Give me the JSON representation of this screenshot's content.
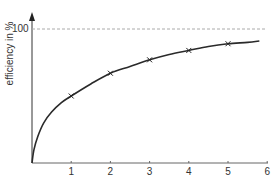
{
  "chart_data": {
    "type": "line",
    "title": "",
    "xlabel": "",
    "ylabel": "efficiency in %",
    "x_ticks": [
      "1",
      "2",
      "3",
      "4",
      "5",
      "6"
    ],
    "y_ticks": [
      "100"
    ],
    "xlim": [
      0,
      6
    ],
    "ylim": [
      0,
      100
    ],
    "reference_line": {
      "y": 100,
      "style": "dashed",
      "color": "#aaaaaa"
    },
    "grid": false,
    "legend": null,
    "series": [
      {
        "name": "efficiency",
        "marker": "x",
        "color": "#2a2a2a",
        "curve_x": [
          0,
          0.05,
          0.15,
          0.3,
          0.5,
          0.75,
          1,
          1.5,
          2,
          2.5,
          3,
          3.5,
          4,
          4.5,
          5,
          5.5,
          5.8
        ],
        "curve_y": [
          0,
          10,
          20,
          30,
          38,
          45,
          50,
          59,
          67,
          72,
          77,
          81,
          84,
          87,
          89,
          90,
          91
        ],
        "marker_x": [
          1,
          2,
          3,
          4,
          5
        ],
        "marker_y": [
          50,
          67,
          77,
          84,
          89
        ]
      }
    ]
  },
  "labels": {
    "ylabel": "efficiency in %",
    "y100": "100",
    "xticks": [
      "1",
      "2",
      "3",
      "4",
      "5",
      "6"
    ]
  }
}
